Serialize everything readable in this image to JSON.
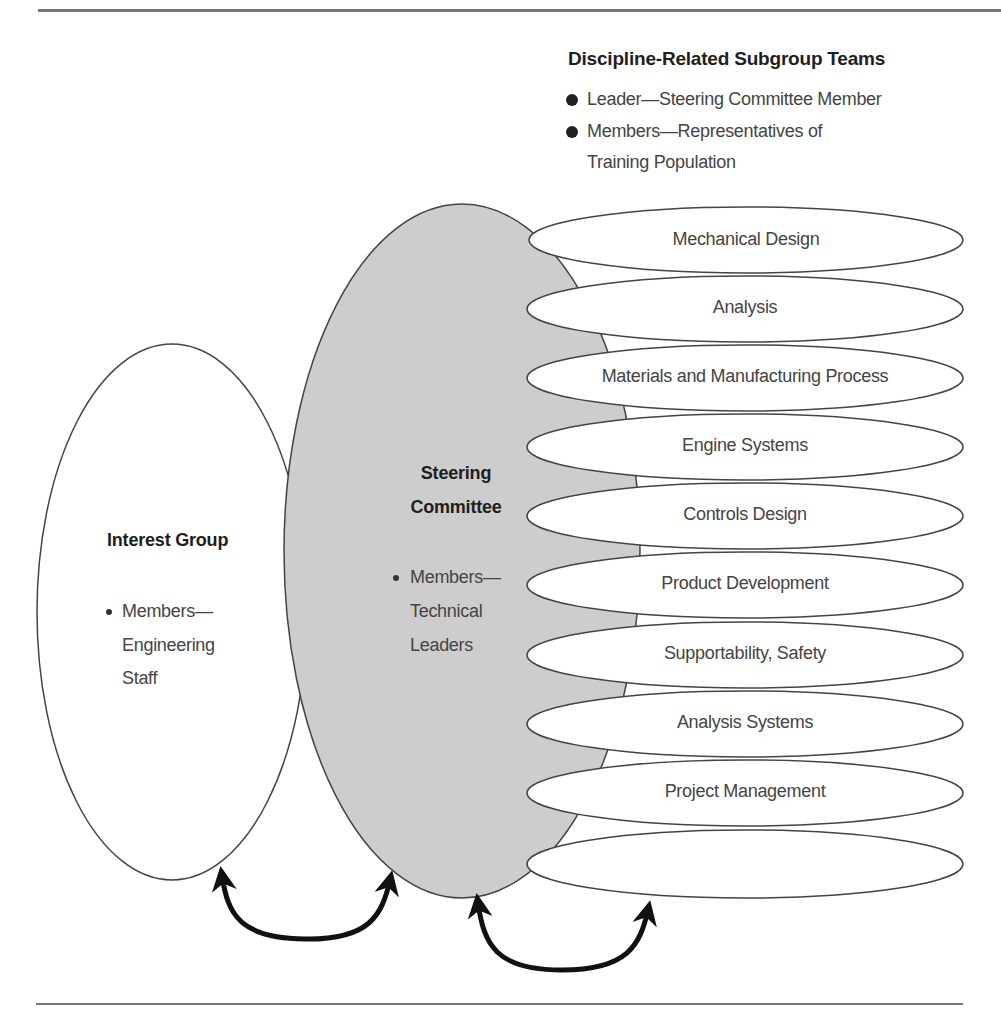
{
  "figure": {
    "title_partial": ""
  },
  "subgroup_legend": {
    "heading": "Discipline-Related Subgroup Teams",
    "items": [
      {
        "line1": "Leader—Steering Committee Member",
        "line2": ""
      },
      {
        "line1": "Members—Representatives of",
        "line2": "Training Population"
      }
    ]
  },
  "interest_group": {
    "title": "Interest Group",
    "bullet_line1": "Members—",
    "bullet_line2": "Engineering",
    "bullet_line3": "Staff"
  },
  "steering_committee": {
    "title_line1": "Steering",
    "title_line2": "Committee",
    "bullet_line1": "Members—",
    "bullet_line2": "Technical",
    "bullet_line3": "Leaders"
  },
  "teams": [
    {
      "label": "Mechanical Design"
    },
    {
      "label": "Analysis"
    },
    {
      "label": "Materials and Manufacturing Process"
    },
    {
      "label": "Engine Systems"
    },
    {
      "label": "Controls Design"
    },
    {
      "label": "Product Development"
    },
    {
      "label": "Supportability, Safety"
    },
    {
      "label": "Analysis Systems"
    },
    {
      "label": "Project Management"
    },
    {
      "label": ""
    }
  ],
  "arrows": [
    {
      "from": "interest-group",
      "to": "steering-committee",
      "type": "bidirectional"
    },
    {
      "from": "steering-committee",
      "to": "subgroup-teams",
      "type": "bidirectional"
    }
  ],
  "colors": {
    "steering_fill": "#cdcdcd",
    "outline": "#444444",
    "arrow": "#111111",
    "rule": "#777777"
  }
}
